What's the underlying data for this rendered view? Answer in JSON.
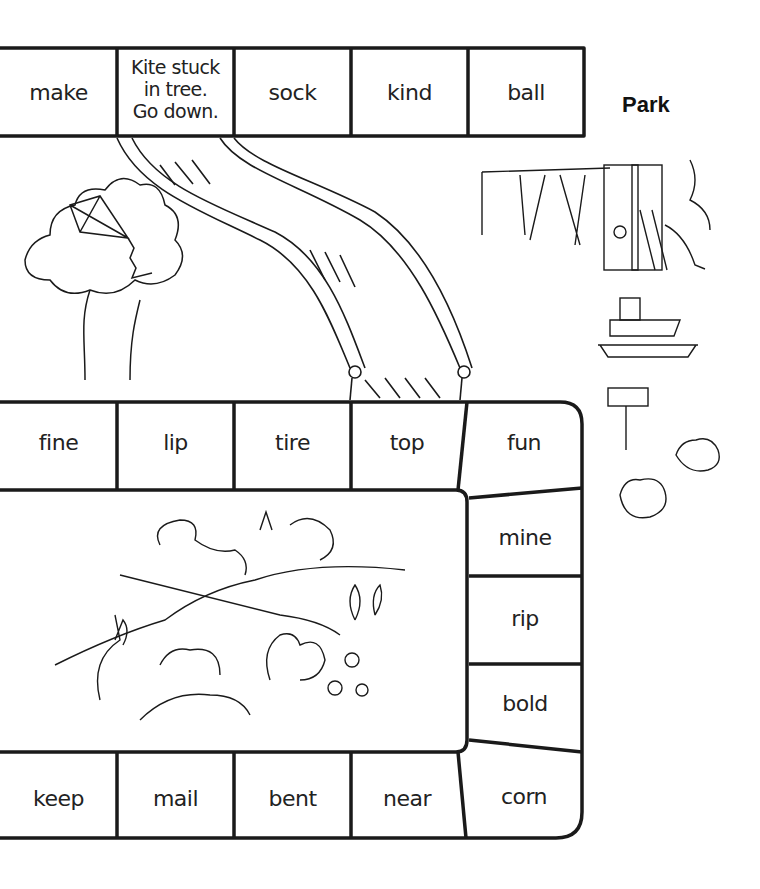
{
  "title": "Park",
  "top_row": [
    "make",
    "Kite stuck in tree. Go down.",
    "sock",
    "kind",
    "ball"
  ],
  "top_row_lines": [
    "Kite stuck",
    "in tree.",
    "Go down."
  ],
  "middle_row": [
    "fine",
    "lip",
    "tire",
    "top",
    "fun"
  ],
  "right_column": [
    "mine",
    "rip",
    "bold"
  ],
  "bottom_row": [
    "keep",
    "mail",
    "bent",
    "near",
    "corn"
  ],
  "illustrations": {
    "slide": "playground-slide",
    "tree_kite": "kite-stuck-in-tree",
    "park_scene": "swings-picnic-table-grill",
    "animal_scene": "rabbits-and-squirrels"
  }
}
